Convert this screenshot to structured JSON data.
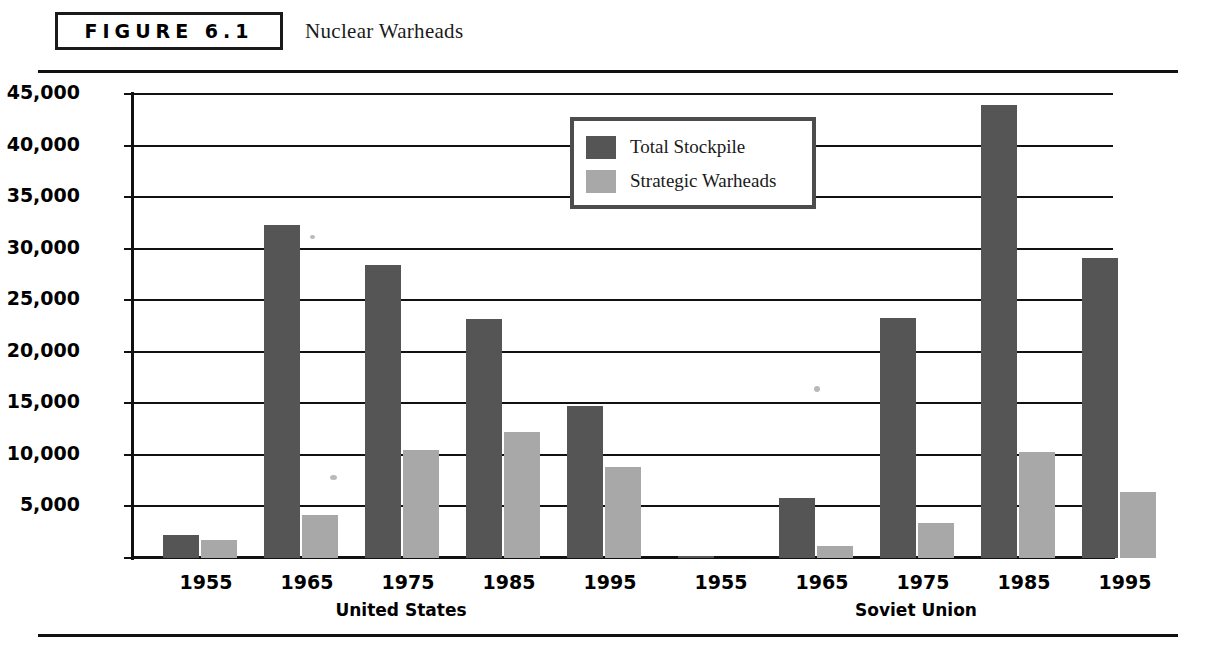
{
  "figure": {
    "badge_label": "FIGURE 6.1",
    "caption": "Nuclear Warheads"
  },
  "legend": {
    "position": "inside-top-center",
    "entries": [
      {
        "label": "Total Stockpile",
        "color": "#555555"
      },
      {
        "label": "Strategic Warheads",
        "color": "#a8a8a8"
      }
    ]
  },
  "chart_data": {
    "type": "bar",
    "title": "Nuclear Warheads",
    "xlabel": "",
    "ylabel": "",
    "ylim": [
      0,
      45000
    ],
    "grid": true,
    "y_ticks": [
      0,
      5000,
      10000,
      15000,
      20000,
      25000,
      30000,
      35000,
      40000,
      45000
    ],
    "y_tick_labels": [
      "",
      "5,000",
      "10,000",
      "15,000",
      "20,000",
      "25,000",
      "30,000",
      "35,000",
      "40,000",
      "45,000"
    ],
    "groups": [
      "United States",
      "Soviet Union"
    ],
    "categories": [
      "1955",
      "1965",
      "1975",
      "1985",
      "1995"
    ],
    "series": [
      {
        "name": "Total Stockpile",
        "color": "#555555",
        "values_by_group": {
          "United States": [
            2200,
            32300,
            28400,
            23200,
            14700
          ],
          "Soviet Union": [
            200,
            5800,
            23300,
            43900,
            29100
          ]
        }
      },
      {
        "name": "Strategic Warheads",
        "color": "#a8a8a8",
        "values_by_group": {
          "United States": [
            1700,
            4200,
            10500,
            12200,
            8800
          ],
          "Soviet Union": [
            0,
            1200,
            3400,
            10300,
            6400
          ]
        }
      }
    ]
  }
}
